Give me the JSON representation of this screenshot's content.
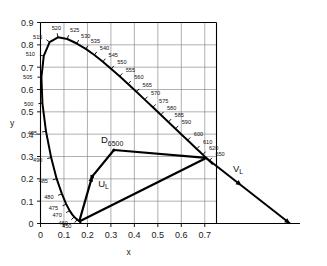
{
  "figure": {
    "axis": {
      "xlabel": "x",
      "ylabel": "y",
      "x_ticks": [
        "0",
        "0.1",
        "0.2",
        "0.3",
        "0.4",
        "0.5",
        "0.6",
        "0.7"
      ],
      "y_ticks": [
        "0",
        "0.1",
        "0.2",
        "0.3",
        "0.4",
        "0.5",
        "0.6",
        "0.7",
        "0.8",
        "0.9"
      ]
    },
    "points": [
      {
        "name": "white-point-d6500",
        "base": "D",
        "sub": "6500",
        "x": 0.313,
        "y": 0.329
      },
      {
        "name": "point-u-l",
        "base": "U",
        "sub": "L",
        "x": 0.22,
        "y": 0.21
      },
      {
        "name": "point-v-l",
        "base": "V",
        "sub": "L",
        "x": 0.8,
        "y": 0.175
      }
    ]
  },
  "chart_data": {
    "type": "line",
    "xlabel": "x",
    "ylabel": "y",
    "xlim": [
      0,
      0.75
    ],
    "ylim": [
      0,
      0.9
    ],
    "grid": true,
    "legend": "none",
    "series": [
      {
        "name": "spectral-locus",
        "type": "line",
        "points": [
          [
            0.1741,
            0.005
          ],
          [
            0.174,
            0.005
          ],
          [
            0.1738,
            0.0049
          ],
          [
            0.1736,
            0.0049
          ],
          [
            0.1733,
            0.0048
          ],
          [
            0.173,
            0.0048
          ],
          [
            0.1726,
            0.0048
          ],
          [
            0.1721,
            0.0048
          ],
          [
            0.1714,
            0.0051
          ],
          [
            0.1703,
            0.0058
          ],
          [
            0.1689,
            0.0069
          ],
          [
            0.1669,
            0.0086
          ],
          [
            0.1644,
            0.0109
          ],
          [
            0.1611,
            0.0138
          ],
          [
            0.1566,
            0.0177
          ],
          [
            0.151,
            0.0227
          ],
          [
            0.144,
            0.0297
          ],
          [
            0.1355,
            0.0399
          ],
          [
            0.1241,
            0.0578
          ],
          [
            0.1096,
            0.0868
          ],
          [
            0.0913,
            0.1327
          ],
          [
            0.0687,
            0.2007
          ],
          [
            0.0454,
            0.295
          ],
          [
            0.0235,
            0.4127
          ],
          [
            0.0082,
            0.5384
          ],
          [
            0.0039,
            0.6548
          ],
          [
            0.0139,
            0.7502
          ],
          [
            0.0389,
            0.812
          ],
          [
            0.0743,
            0.8338
          ],
          [
            0.1142,
            0.8262
          ],
          [
            0.1547,
            0.8059
          ],
          [
            0.1929,
            0.7816
          ],
          [
            0.2296,
            0.7543
          ],
          [
            0.2658,
            0.7243
          ],
          [
            0.3016,
            0.6923
          ],
          [
            0.3373,
            0.6589
          ],
          [
            0.3731,
            0.6245
          ],
          [
            0.4087,
            0.5896
          ],
          [
            0.4441,
            0.5547
          ],
          [
            0.4788,
            0.5202
          ],
          [
            0.5125,
            0.4866
          ],
          [
            0.5448,
            0.4544
          ],
          [
            0.5752,
            0.4242
          ],
          [
            0.6029,
            0.3965
          ],
          [
            0.627,
            0.3725
          ],
          [
            0.6482,
            0.3514
          ],
          [
            0.6658,
            0.334
          ],
          [
            0.6801,
            0.3197
          ],
          [
            0.6915,
            0.3083
          ],
          [
            0.7006,
            0.2993
          ],
          [
            0.7079,
            0.292
          ],
          [
            0.714,
            0.2859
          ],
          [
            0.719,
            0.2809
          ],
          [
            0.723,
            0.277
          ],
          [
            0.726,
            0.274
          ],
          [
            0.7283,
            0.2717
          ],
          [
            0.73,
            0.27
          ],
          [
            0.7311,
            0.2689
          ],
          [
            0.732,
            0.268
          ],
          [
            0.7327,
            0.2673
          ],
          [
            0.7334,
            0.2666
          ],
          [
            0.734,
            0.266
          ],
          [
            0.7344,
            0.2656
          ],
          [
            0.7346,
            0.2654
          ],
          [
            0.7347,
            0.2653
          ]
        ]
      },
      {
        "name": "purple-line",
        "type": "line",
        "points": [
          [
            0.7347,
            0.2653
          ],
          [
            0.1741,
            0.005
          ]
        ]
      },
      {
        "name": "u-l-path",
        "type": "line",
        "points": [
          [
            0.165,
            0.009
          ],
          [
            0.22,
            0.21
          ],
          [
            0.313,
            0.329
          ]
        ]
      },
      {
        "name": "d6500-to-locus",
        "type": "line",
        "points": [
          [
            0.313,
            0.329
          ],
          [
            0.706,
            0.2935
          ]
        ]
      },
      {
        "name": "v-l-ray",
        "type": "line",
        "points": [
          [
            0.165,
            0.009
          ],
          [
            0.706,
            0.2935
          ]
        ]
      },
      {
        "name": "locus-to-v-l-arrow",
        "type": "line",
        "points": [
          [
            0.706,
            0.2935
          ],
          [
            1.15,
            0.07
          ]
        ]
      }
    ],
    "wavelength_ticks": [
      {
        "label": "450",
        "x": 0.1566,
        "y": 0.0177
      },
      {
        "label": "460",
        "x": 0.144,
        "y": 0.0297
      },
      {
        "label": "470",
        "x": 0.1241,
        "y": 0.0578
      },
      {
        "label": "475",
        "x": 0.1096,
        "y": 0.0868
      },
      {
        "label": "480",
        "x": 0.0913,
        "y": 0.1327
      },
      {
        "label": "485",
        "x": 0.0687,
        "y": 0.2007
      },
      {
        "label": "490",
        "x": 0.0454,
        "y": 0.295
      },
      {
        "label": "495",
        "x": 0.0235,
        "y": 0.4127
      },
      {
        "label": "500",
        "x": 0.0082,
        "y": 0.5384
      },
      {
        "label": "505",
        "x": 0.0039,
        "y": 0.6548
      },
      {
        "label": "510",
        "x": 0.0139,
        "y": 0.7502
      },
      {
        "label": "515",
        "x": 0.0389,
        "y": 0.812
      },
      {
        "label": "520",
        "x": 0.0743,
        "y": 0.8338
      },
      {
        "label": "525",
        "x": 0.1142,
        "y": 0.8262
      },
      {
        "label": "530",
        "x": 0.1547,
        "y": 0.8059
      },
      {
        "label": "535",
        "x": 0.1929,
        "y": 0.7816
      },
      {
        "label": "540",
        "x": 0.2296,
        "y": 0.7543
      },
      {
        "label": "545",
        "x": 0.2658,
        "y": 0.7243
      },
      {
        "label": "550",
        "x": 0.3016,
        "y": 0.6923
      },
      {
        "label": "555",
        "x": 0.3373,
        "y": 0.6589
      },
      {
        "label": "560",
        "x": 0.3731,
        "y": 0.6245
      },
      {
        "label": "565",
        "x": 0.4087,
        "y": 0.5896
      },
      {
        "label": "570",
        "x": 0.4441,
        "y": 0.5547
      },
      {
        "label": "575",
        "x": 0.4788,
        "y": 0.5202
      },
      {
        "label": "580",
        "x": 0.5125,
        "y": 0.4866
      },
      {
        "label": "585",
        "x": 0.5448,
        "y": 0.4544
      },
      {
        "label": "590",
        "x": 0.5752,
        "y": 0.4242
      },
      {
        "label": "600",
        "x": 0.627,
        "y": 0.3725
      },
      {
        "label": "610",
        "x": 0.6658,
        "y": 0.334
      },
      {
        "label": "620",
        "x": 0.6915,
        "y": 0.3083
      },
      {
        "label": "650",
        "x": 0.719,
        "y": 0.2809
      }
    ],
    "annotations": [
      {
        "text": "D6500",
        "x": 0.313,
        "y": 0.329
      },
      {
        "text": "UL",
        "x": 0.22,
        "y": 0.21
      },
      {
        "text": "VL",
        "x": 0.8,
        "y": 0.175
      }
    ]
  }
}
